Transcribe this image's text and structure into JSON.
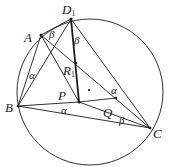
{
  "diagram": {
    "type": "geometry-circle-construction",
    "colors": {
      "stroke": "#1a1a1a",
      "background": "#ffffff"
    },
    "circle": {
      "cx": 90,
      "cy": 92,
      "r": 73
    },
    "points": {
      "D1": {
        "label": "D",
        "sub": "1",
        "x": 71,
        "y": 19
      },
      "A": {
        "label": "A",
        "x": 41,
        "y": 35
      },
      "B": {
        "label": "B",
        "x": 18,
        "y": 106
      },
      "C": {
        "label": "C",
        "x": 150,
        "y": 128
      },
      "P": {
        "label": "P",
        "x": 79,
        "y": 102
      },
      "Q": {
        "label": "Q",
        "x": 116,
        "y": 98
      },
      "R1": {
        "label": "R",
        "sub": "1",
        "x": 76,
        "y": 63
      },
      "O": {
        "label": "",
        "x": 89,
        "y": 90
      }
    },
    "segments": [
      [
        "A",
        "D1"
      ],
      [
        "D1",
        "B"
      ],
      [
        "D1",
        "C"
      ],
      [
        "D1",
        "P"
      ],
      [
        "A",
        "B"
      ],
      [
        "A",
        "C"
      ],
      [
        "A",
        "P"
      ],
      [
        "B",
        "P"
      ],
      [
        "B",
        "C"
      ],
      [
        "P",
        "Q"
      ],
      [
        "P",
        "C"
      ]
    ],
    "angle_labels": [
      {
        "text": "β",
        "near": "A",
        "x": 52,
        "y": 38
      },
      {
        "text": "β",
        "near": "D1",
        "x": 72,
        "y": 44
      },
      {
        "text": "α",
        "near": "B",
        "x": 29,
        "y": 78
      },
      {
        "text": "α",
        "near": "B-C",
        "x": 64,
        "y": 114
      },
      {
        "text": "α",
        "near": "Q",
        "x": 111,
        "y": 93
      },
      {
        "text": "β",
        "near": "C",
        "x": 119,
        "y": 123
      }
    ]
  }
}
